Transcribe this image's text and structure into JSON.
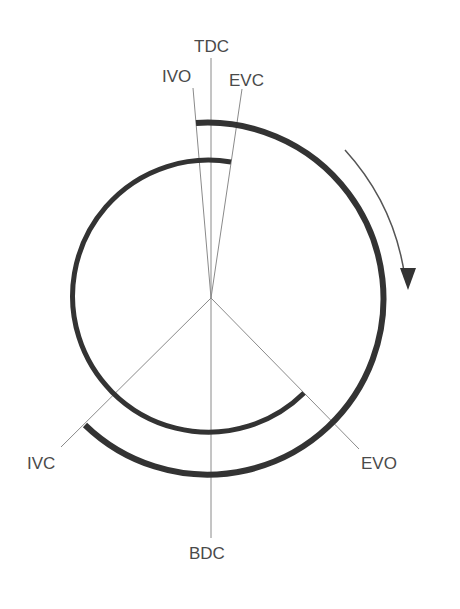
{
  "diagram": {
    "labels": {
      "tdc": "TDC",
      "bdc": "BDC",
      "ivo": "IVO",
      "ivc": "IVC",
      "evo": "EVO",
      "evc": "EVC"
    },
    "rotation_direction": "clockwise",
    "colors": {
      "arc": "#333333",
      "line": "#808080",
      "text": "#4a4a4a"
    }
  }
}
